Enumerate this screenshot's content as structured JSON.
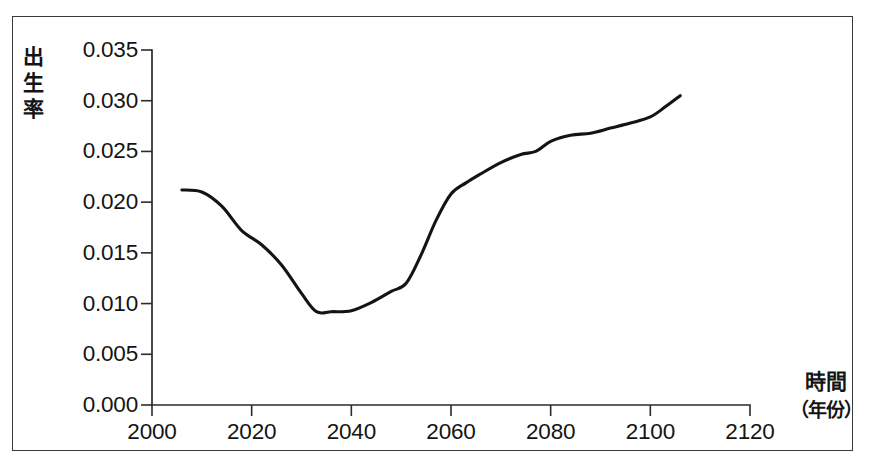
{
  "figure": {
    "frame_color": "#3a3a3a",
    "line_color": "#141414",
    "background": "#ffffff"
  },
  "axes": {
    "y_axis_title_chars": [
      "出",
      "生",
      "率"
    ],
    "x_axis_title": "時間",
    "x_axis_unit": "（年份）"
  },
  "chart_data": {
    "type": "line",
    "title": "",
    "subtitle": "",
    "xlabel": "時間（年份）",
    "ylabel": "出生率",
    "xlim": [
      2000,
      2120
    ],
    "ylim": [
      0.0,
      0.035
    ],
    "grid": false,
    "legend": null,
    "xticks": [
      2000,
      2020,
      2040,
      2060,
      2080,
      2100,
      2120
    ],
    "xtick_labels": [
      "2000",
      "2020",
      "2040",
      "2060",
      "2080",
      "2100",
      "2120"
    ],
    "yticks": [
      0.0,
      0.005,
      0.01,
      0.015,
      0.02,
      0.025,
      0.03,
      0.035
    ],
    "ytick_labels": [
      "0.000",
      "0.005",
      "0.010",
      "0.015",
      "0.020",
      "0.025",
      "0.030",
      "0.035"
    ],
    "series": [
      {
        "name": "出生率",
        "color": "#141414",
        "x": [
          2006,
          2010,
          2014,
          2018,
          2022,
          2026,
          2030,
          2033,
          2036,
          2040,
          2044,
          2048,
          2051,
          2054,
          2057,
          2060,
          2063,
          2066,
          2070,
          2074,
          2077,
          2080,
          2084,
          2088,
          2092,
          2096,
          2100,
          2103,
          2106
        ],
        "y": [
          0.0212,
          0.021,
          0.0196,
          0.0172,
          0.0158,
          0.0138,
          0.011,
          0.0092,
          0.0092,
          0.0093,
          0.0101,
          0.0112,
          0.012,
          0.0148,
          0.0182,
          0.0208,
          0.0219,
          0.0228,
          0.0239,
          0.0247,
          0.025,
          0.026,
          0.0266,
          0.0268,
          0.0273,
          0.0278,
          0.0284,
          0.0294,
          0.0305
        ]
      }
    ]
  }
}
